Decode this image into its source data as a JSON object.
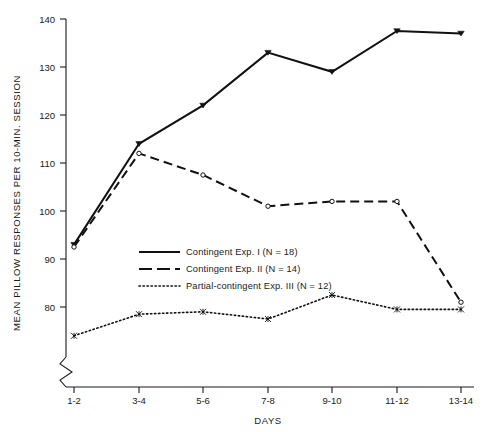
{
  "chart_data": {
    "type": "line",
    "title": "",
    "xlabel": "DAYS",
    "ylabel": "MEAN PILLOW RESPONSES PER 10-MIN. SESSION",
    "categories": [
      "1-2",
      "3-4",
      "5-6",
      "7-8",
      "9-10",
      "11-12",
      "13-14"
    ],
    "ylim": [
      74,
      140
    ],
    "y_ticks": [
      80,
      90,
      100,
      110,
      120,
      130,
      140
    ],
    "y_axis_break": true,
    "grid": false,
    "legend_position": "center-left",
    "series": [
      {
        "name": "Contingent Exp. I (N = 18)",
        "style": "solid",
        "marker": "filled-triangle",
        "values": [
          93,
          114,
          122,
          133,
          129,
          137.5,
          137
        ]
      },
      {
        "name": "Contingent Exp. II (N = 14)",
        "style": "dashed",
        "marker": "open-circle",
        "values": [
          92.5,
          112,
          107.5,
          101,
          102,
          102,
          81
        ]
      },
      {
        "name": "Partial-contingent Exp. III (N = 12)",
        "style": "dotted",
        "marker": "open-star",
        "values": [
          74,
          78.5,
          79,
          77.5,
          82.5,
          79.5,
          79.5
        ]
      }
    ]
  },
  "legend": {
    "items": [
      {
        "label": "Contingent Exp. I (N = 18)",
        "style": "solid"
      },
      {
        "label": "Contingent Exp. II (N = 14)",
        "style": "dashed"
      },
      {
        "label": "Partial-contingent Exp. III (N = 12)",
        "style": "dotted"
      }
    ]
  },
  "axes": {
    "y_tick_labels": [
      "140",
      "130",
      "120",
      "110",
      "100",
      "90",
      "80"
    ],
    "x_tick_labels": [
      "1-2",
      "3-4",
      "5-6",
      "7-8",
      "9-10",
      "11-12",
      "13-14"
    ],
    "y_title": "MEAN PILLOW RESPONSES PER 10-MIN. SESSION",
    "x_title": "DAYS"
  }
}
